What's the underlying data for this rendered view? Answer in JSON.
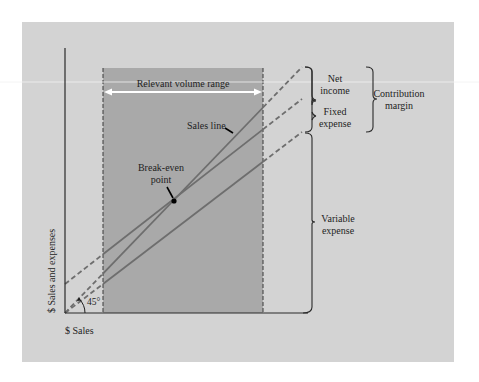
{
  "diagram": {
    "axes": {
      "y_label": "$ Sales and expenses",
      "x_label": "$ Sales",
      "angle_label": "45°"
    },
    "region": {
      "label": "Relevant volume range"
    },
    "lines": {
      "sales": "Sales line",
      "break_even": "Break-even",
      "break_even_2": "point"
    },
    "brackets": {
      "net_income_1": "Net",
      "net_income_2": "income",
      "fixed_expense_1": "Fixed",
      "fixed_expense_2": "expense",
      "variable_expense_1": "Variable",
      "variable_expense_2": "expense",
      "contribution_margin_1": "Contribution",
      "contribution_margin_2": "margin"
    },
    "colors": {
      "page": "#ffffff",
      "panel": "#d3d3d3",
      "shaded_region": "#a9a9a9",
      "line": "#6e6e6e",
      "axis": "#2a2a2a",
      "text": "#1e1e1e",
      "arrow": "#ffffff"
    }
  }
}
